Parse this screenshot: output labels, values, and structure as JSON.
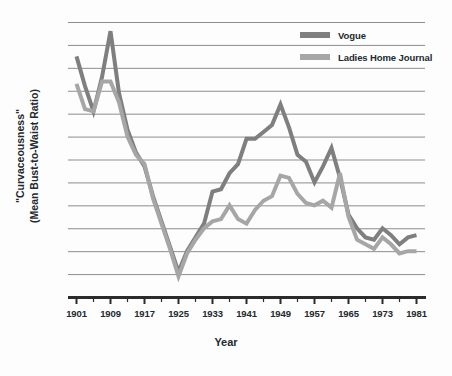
{
  "chart_data": {
    "type": "line",
    "title": "",
    "xlabel": "Year",
    "ylabel": "\"Curvaceousness\"\n(Mean Bust-to-Waist Ratio)",
    "ylabel_line1": "\"Curvaceousness\"",
    "ylabel_line2": "(Mean Bust-to-Waist Ratio)",
    "grid": "horizontal",
    "legend_position": "top-right",
    "xlim": [
      1899,
      1983
    ],
    "ylim": [
      0,
      12
    ],
    "y_ticks_visible": false,
    "x_major_ticks": [
      1901,
      1909,
      1917,
      1925,
      1933,
      1941,
      1949,
      1957,
      1965,
      1973,
      1981
    ],
    "x_minor_tick_interval": 4,
    "x_tick_labels": [
      "1901",
      "1909",
      "1917",
      "1925",
      "1933",
      "1941",
      "1949",
      "1957",
      "1965",
      "1973",
      "1981"
    ],
    "gridline_count": 12,
    "series": [
      {
        "name": "Vogue",
        "color": "#7f7f7f",
        "x": [
          1901,
          1903,
          1905,
          1907,
          1909,
          1911,
          1913,
          1915,
          1917,
          1919,
          1921,
          1923,
          1925,
          1927,
          1929,
          1931,
          1933,
          1935,
          1937,
          1939,
          1941,
          1943,
          1945,
          1947,
          1949,
          1951,
          1953,
          1955,
          1957,
          1959,
          1961,
          1963,
          1965,
          1967,
          1969,
          1971,
          1973,
          1975,
          1977,
          1979,
          1981
        ],
        "values": [
          10.5,
          9.2,
          8.1,
          9.6,
          11.6,
          8.9,
          7.3,
          6.3,
          5.7,
          4.4,
          3.3,
          2.2,
          1.1,
          2.0,
          2.6,
          3.2,
          4.6,
          4.7,
          5.4,
          5.8,
          6.9,
          6.9,
          7.2,
          7.5,
          8.4,
          7.4,
          6.2,
          5.9,
          5.0,
          5.7,
          6.5,
          5.2,
          3.6,
          3.0,
          2.6,
          2.5,
          3.0,
          2.7,
          2.3,
          2.6,
          2.7
        ]
      },
      {
        "name": "Ladies Home Journal",
        "color": "#a6a6a6",
        "x": [
          1901,
          1903,
          1905,
          1907,
          1909,
          1911,
          1913,
          1915,
          1917,
          1919,
          1921,
          1923,
          1925,
          1927,
          1929,
          1931,
          1933,
          1935,
          1937,
          1939,
          1941,
          1943,
          1945,
          1947,
          1949,
          1951,
          1953,
          1955,
          1957,
          1959,
          1961,
          1963,
          1965,
          1967,
          1969,
          1971,
          1973,
          1975,
          1977,
          1979,
          1981
        ],
        "values": [
          9.3,
          8.2,
          8.1,
          9.4,
          9.4,
          8.5,
          7.0,
          6.2,
          5.8,
          4.3,
          3.2,
          2.1,
          0.9,
          1.9,
          2.5,
          3.0,
          3.3,
          3.4,
          4.0,
          3.4,
          3.2,
          3.8,
          4.2,
          4.4,
          5.3,
          5.2,
          4.5,
          4.1,
          4.0,
          4.2,
          3.9,
          5.4,
          3.5,
          2.5,
          2.3,
          2.1,
          2.6,
          2.3,
          1.9,
          2.0,
          2.0
        ]
      }
    ]
  },
  "legend": {
    "items": [
      {
        "label": "Vogue",
        "color": "#7f7f7f"
      },
      {
        "label": "Ladies Home Journal",
        "color": "#a6a6a6"
      }
    ]
  },
  "axes": {
    "x_title": "Year",
    "y_title_line1": "\"Curvaceousness\"",
    "y_title_line2": "(Mean Bust-to-Waist Ratio)",
    "x_tick_labels": [
      "1901",
      "1909",
      "1917",
      "1925",
      "1933",
      "1941",
      "1949",
      "1957",
      "1965",
      "1973",
      "1981"
    ]
  },
  "colors": {
    "background": "#fdfdfd",
    "gridline": "#8d8d8d",
    "axis": "#2b2b2b",
    "text": "#23292e",
    "series_vogue": "#7f7f7f",
    "series_lhj": "#a6a6a6"
  }
}
